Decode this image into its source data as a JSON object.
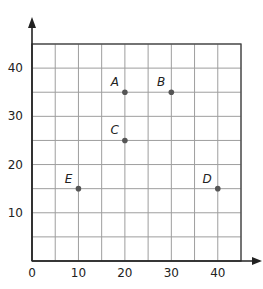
{
  "chart_data": {
    "type": "scatter",
    "title": "",
    "xlabel": "",
    "ylabel": "",
    "xlim": [
      0,
      45
    ],
    "ylim": [
      0,
      45
    ],
    "grid": true,
    "grid_step": 5,
    "x_ticks": [
      0,
      10,
      20,
      30,
      40
    ],
    "y_ticks": [
      10,
      20,
      30,
      40
    ],
    "x_tick_labels": [
      "0",
      "10",
      "20",
      "30",
      "40"
    ],
    "y_tick_labels": [
      "10",
      "20",
      "30",
      "40"
    ],
    "points": [
      {
        "label": "A",
        "x": 20,
        "y": 35
      },
      {
        "label": "B",
        "x": 30,
        "y": 35
      },
      {
        "label": "C",
        "x": 20,
        "y": 25
      },
      {
        "label": "D",
        "x": 40,
        "y": 15
      },
      {
        "label": "E",
        "x": 10,
        "y": 15
      }
    ],
    "legend": null
  },
  "colors": {
    "grid": "#9e9e9e",
    "axis": "#222222",
    "point": "#555555",
    "text": "#222222"
  }
}
